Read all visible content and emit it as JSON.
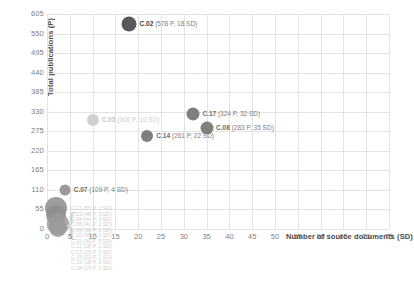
{
  "chart_data": {
    "type": "scatter",
    "title": "",
    "xlabel": "Number of source documents (SD)",
    "ylabel": "Total publications (P)",
    "xlim": [
      0,
      75
    ],
    "ylim": [
      0,
      605
    ],
    "xticks": [
      "0",
      "5",
      "10",
      "15",
      "20",
      "25",
      "30",
      "35",
      "40",
      "45",
      "50",
      "55",
      "60",
      "65",
      "70",
      "75"
    ],
    "yticks": [
      "0",
      "55",
      "110",
      "165",
      "220",
      "275",
      "330",
      "385",
      "440",
      "495",
      "550",
      "605"
    ],
    "grid": true,
    "legend": "none",
    "points": [
      {
        "id": "C.02",
        "x": 18,
        "y": 578,
        "label": "C.02",
        "detail": "(578 P, 18 SD)",
        "color": "#595959",
        "size": 7.5,
        "emphasis": "dark"
      },
      {
        "id": "C.17",
        "x": 32,
        "y": 324,
        "label": "C.17",
        "detail": "(324 P, 32 SD)",
        "color": "#7f7f7f",
        "size": 6.5,
        "emphasis": "mid"
      },
      {
        "id": "C.08",
        "x": 35,
        "y": 283,
        "label": "C.08",
        "detail": "(283 P, 35 SD)",
        "color": "#7f7f7f",
        "size": 6.5,
        "emphasis": "mid"
      },
      {
        "id": "C.14",
        "x": 22,
        "y": 261,
        "label": "C.14",
        "detail": "(261 P, 22 SD)",
        "color": "#7f7f7f",
        "size": 6,
        "emphasis": "mid"
      },
      {
        "id": "C.05",
        "x": 10,
        "y": 306,
        "label": "C.05",
        "detail": "(306 P, 10 SD)",
        "color": "#d0d0d0",
        "size": 6,
        "emphasis": "light"
      },
      {
        "id": "C.07",
        "x": 4,
        "y": 109,
        "label": "C.07",
        "detail": "(109 P, 4 SD)",
        "color": "#9a9a9a",
        "size": 5.5,
        "emphasis": "mid"
      }
    ],
    "cluster": {
      "note": "dense overlapping cluster of low-value categories near origin",
      "labels": [
        "C.01 (55 P, 2 SD)",
        "C.03 (48 P, 3 SD)",
        "C.04 (44 P, 3 SD)",
        "C.06 (41 P, 2 SD)",
        "C.09 (38 P, 3 SD)",
        "C.10 (35 P, 2 SD)",
        "C.11 (30 P, 3 SD)",
        "C.12 (28 P, 2 SD)",
        "C.13 (25 P, 3 SD)",
        "C.15 (22 P, 2 SD)",
        "C.16 (18 P, 3 SD)",
        "C.18 (15 P, 2 SD)"
      ],
      "blobs": [
        {
          "x": 2,
          "y": 60,
          "size": 11,
          "color": "#8d8d8d"
        },
        {
          "x": 2,
          "y": 38,
          "size": 10,
          "color": "#8d8d8d"
        },
        {
          "x": 2.5,
          "y": 14,
          "size": 11,
          "color": "#9a9a9a"
        },
        {
          "x": 2.5,
          "y": 2,
          "size": 9,
          "color": "#9a9a9a"
        }
      ]
    }
  }
}
